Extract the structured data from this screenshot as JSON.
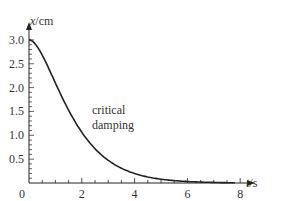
{
  "chart_data": {
    "type": "line",
    "title": "",
    "xlabel": "t/s",
    "ylabel": "x/cm",
    "xlim": [
      0,
      8.5
    ],
    "ylim": [
      0,
      3.3
    ],
    "x_ticks": [
      "0",
      "2",
      "4",
      "6",
      "8"
    ],
    "y_ticks": [
      "0.5",
      "1.0",
      "1.5",
      "2.0",
      "2.5",
      "3.0"
    ],
    "origin_label": "0",
    "grid": false,
    "annotation": [
      "critical",
      "damping"
    ],
    "series": [
      {
        "name": "critical damping",
        "x": [
          0,
          0.5,
          1,
          1.5,
          2,
          2.5,
          3,
          3.5,
          4,
          5,
          6,
          7,
          8
        ],
        "values": [
          3.0,
          2.68,
          2.1,
          1.53,
          1.06,
          0.71,
          0.46,
          0.29,
          0.18,
          0.07,
          0.03,
          0.01,
          0.0
        ]
      }
    ]
  }
}
